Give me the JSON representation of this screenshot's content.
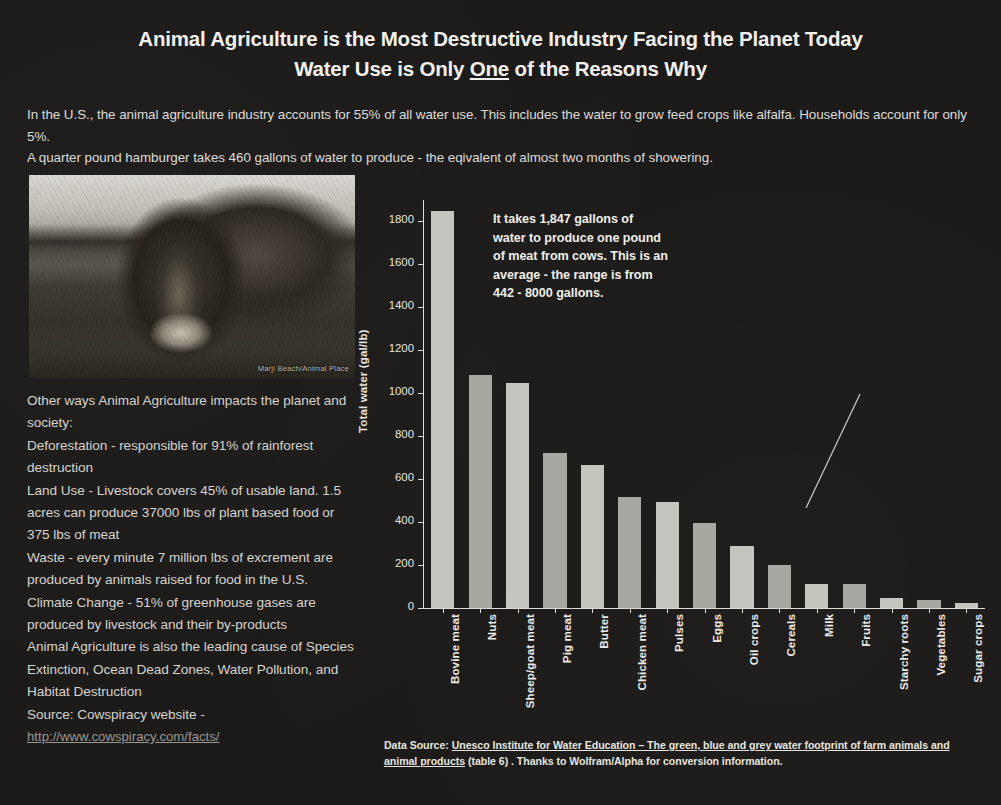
{
  "title": {
    "line1_a": "Animal Agriculture",
    "line1_b": " is the Most Destructive Industry Facing the Planet Today",
    "line2_a": "Water Use is Only ",
    "line2_underlined": "One",
    "line2_b": " of the Reasons Why"
  },
  "intro": {
    "para1": "In the U.S., the animal agriculture industry accounts for 55% of all water use. This includes the water to grow feed crops like alfalfa. Households account for only 5%.",
    "para2": "A quarter pound hamburger takes 460 gallons of water to produce - the eqivalent of almost two months of showering."
  },
  "photo": {
    "alt_name": "cow-photograph",
    "credit": "Marji Beach/Animal Place"
  },
  "left_facts": {
    "heading": "Other ways Animal Agriculture impacts the planet and society:",
    "deforestation": "Deforestation - responsible for 91% of rainforest destruction",
    "land_use": "Land Use - Livestock covers 45% of usable land. 1.5 acres can produce  37000 lbs of plant based food or 375 lbs of meat",
    "waste": "Waste - every minute 7 million lbs of excrement are produced by animals raised for food in the U.S.",
    "climate": "Climate Change - 51% of greenhouse gases are produced by livestock and their by-products",
    "leading_cause": "Animal Agriculture is also the leading cause of Species Extinction, Ocean Dead Zones, Water Pollution, and Habitat Destruction",
    "source_label": "Source: Cowspiracy website -",
    "source_url": "http://www.cowspiracy.com/facts/"
  },
  "callout": {
    "text": "It takes 1,847 gallons of water to produce one pound of meat from cows. This is an average - the range is from 442 - 8000 gallons."
  },
  "footer": {
    "prefix": "Data Source: ",
    "underlined": "Unesco Institute for Water Education – The green, blue and grey water footprint of farm animals and animal products",
    "suffix": " (table 6) . Thanks to Wolfram/Alpha for conversion information."
  },
  "colors": {
    "background": "#1b1a19",
    "text": "#dedcd8",
    "bar_light": "#c6c4bf",
    "bar_dark": "#a9a7a2",
    "axis": "#dedcd7"
  },
  "chart_data": {
    "type": "bar",
    "title": "",
    "xlabel": "",
    "ylabel": "Total water (gal/lb)",
    "ylim": [
      0,
      1900
    ],
    "yticks": [
      0,
      200,
      400,
      600,
      800,
      1000,
      1200,
      1400,
      1600,
      1800
    ],
    "grid": false,
    "legend": "none",
    "categories": [
      "Bovine meat",
      "Nuts",
      "Sheep/goat meat",
      "Pig meat",
      "Butter",
      "Chicken meat",
      "Pulses",
      "Eggs",
      "Oil crops",
      "Cereals",
      "Milk",
      "Fruits",
      "Starchy roots",
      "Vegetables",
      "Sugar crops"
    ],
    "values": [
      1847,
      1086,
      1048,
      724,
      667,
      519,
      494,
      395,
      288,
      202,
      113,
      111,
      46,
      38,
      23
    ],
    "units": "gal/lb",
    "annotations": [
      {
        "target_category": "Bovine meat",
        "text": "It takes 1,847 gallons of water to produce one pound of meat from cows. This is an average - the range is from 442 - 8000 gallons."
      }
    ]
  }
}
